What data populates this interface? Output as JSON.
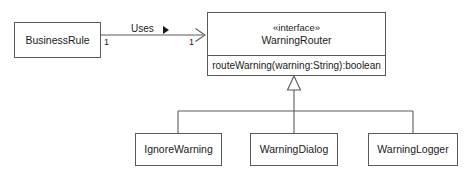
{
  "diagram": {
    "kind": "uml-class-diagram",
    "line_color": "#5a5a5a",
    "text_color": "#1a1a1a",
    "background": "#ffffff",
    "interface": {
      "stereotype": "«interface»",
      "name": "WarningRouter",
      "operations": [
        "routeWarning(warning:String):boolean"
      ]
    },
    "client_class": {
      "name": "BusinessRule"
    },
    "association": {
      "label": "Uses",
      "source_multiplicity": "1",
      "target_multiplicity": "1",
      "direction_marker": "solid-triangle-right",
      "arrowhead": "open-arrow"
    },
    "generalization": {
      "arrowhead": "hollow-triangle",
      "subclasses": [
        {
          "name": "IgnoreWarning"
        },
        {
          "name": "WarningDialog"
        },
        {
          "name": "WarningLogger"
        }
      ]
    }
  }
}
